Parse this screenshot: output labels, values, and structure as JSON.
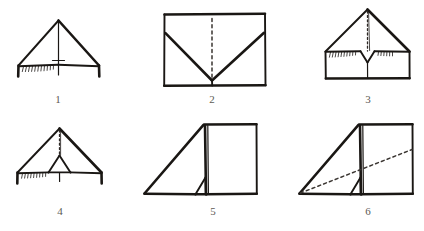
{
  "document": {
    "kind": "instruction-diagram",
    "subject": "paper folding step sequence",
    "background_color": "#ffffff",
    "ink_color": "#1a1714",
    "caption_color": "#5d5953",
    "dashed_color": "#3a3531"
  },
  "layout": {
    "width": 424,
    "height": 231,
    "rows": 2,
    "columns": 3
  },
  "figures": [
    {
      "number": "1",
      "caption": "1",
      "caption_x": 58,
      "caption_y": 103,
      "description": "front view, wide triangle with vertical center crease, hatched fold flap at base and two short side legs"
    },
    {
      "number": "2",
      "caption": "2",
      "caption_x": 212,
      "caption_y": 103,
      "description": "flat rectangle with V-shaped crease converging at bottom center and dashed vertical center line"
    },
    {
      "number": "3",
      "caption": "3",
      "caption_x": 368,
      "caption_y": 103,
      "description": "triangle above rectangle, dashed center crease and small inverted V notch with hatching"
    },
    {
      "number": "4",
      "caption": "4",
      "caption_x": 60,
      "caption_y": 215,
      "description": "narrow triangle with dashed center crease, small inner triangle, hatched base flap and side legs"
    },
    {
      "number": "5",
      "caption": "5",
      "caption_x": 213,
      "caption_y": 215,
      "description": "side view, sloping triangle at left joined to upright rectangle at right with small inner wedge"
    },
    {
      "number": "6",
      "caption": "6",
      "caption_x": 368,
      "caption_y": 215,
      "description": "same side view as step 5 with dashed diagonal fold line from lower-left corner to right edge"
    }
  ]
}
